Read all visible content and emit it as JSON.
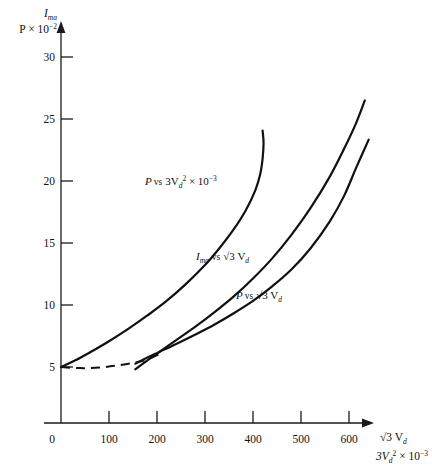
{
  "chart_data": {
    "type": "line",
    "title": "",
    "xlabel_line1": "√3 V",
    "xlabel_line1_sub": "d",
    "xlabel_line2_base": "3V",
    "xlabel_line2_sub": "d",
    "xlabel_line2_sup": "2",
    "xlabel_line2_tail": " × 10",
    "xlabel_line2_exp": "−3",
    "ylabel_line1": "I",
    "ylabel_line1_sub": "ma",
    "ylabel_line2_base": "P × 10",
    "ylabel_line2_exp": "−2",
    "xlim": [
      0,
      680
    ],
    "ylim": [
      0,
      32
    ],
    "grid": false,
    "legend_position": "inline-annotations",
    "xticks": [
      0,
      100,
      200,
      300,
      400,
      500,
      600
    ],
    "xtick_labels": [
      "0",
      "100",
      "200",
      "300",
      "400",
      "500",
      "600"
    ],
    "yticks": [
      5,
      10,
      15,
      20,
      25,
      30
    ],
    "ytick_labels": [
      "5",
      "10",
      "15",
      "20",
      "25",
      "30"
    ],
    "series": [
      {
        "name": "P vs 3Vd2 x 10-3",
        "label_text_base": "P",
        "label_vs": "vs",
        "label_mid": "3V",
        "label_sub": "d",
        "label_sup": "2",
        "label_tail": " × 10",
        "label_exp": "−3",
        "style": "solid",
        "points": [
          [
            0,
            5.0
          ],
          [
            30,
            5.6
          ],
          [
            60,
            6.3
          ],
          [
            100,
            7.3
          ],
          [
            140,
            8.4
          ],
          [
            180,
            9.6
          ],
          [
            220,
            10.9
          ],
          [
            260,
            12.4
          ],
          [
            300,
            14.1
          ],
          [
            330,
            15.6
          ],
          [
            360,
            17.3
          ],
          [
            385,
            19.0
          ],
          [
            405,
            20.8
          ],
          [
            415,
            22.2
          ],
          [
            420,
            23.6
          ],
          [
            422,
            25.0
          ],
          [
            420,
            26.1
          ]
        ]
      },
      {
        "name": "Ima vs sqrt3 Vd",
        "label_text_base": "I",
        "label_sub0": "ma",
        "label_vs": "vs",
        "label_mid": "√3 V",
        "label_sub": "d",
        "style": "solid",
        "points": [
          [
            155,
            4.8
          ],
          [
            180,
            5.6
          ],
          [
            205,
            6.35
          ],
          [
            240,
            7.4
          ],
          [
            280,
            8.6
          ],
          [
            320,
            9.9
          ],
          [
            360,
            11.3
          ],
          [
            400,
            12.9
          ],
          [
            440,
            14.7
          ],
          [
            480,
            16.8
          ],
          [
            520,
            19.2
          ],
          [
            560,
            22.0
          ],
          [
            590,
            24.5
          ],
          [
            615,
            26.8
          ],
          [
            633,
            28.8
          ]
        ]
      },
      {
        "name": "P vs sqrt3 Vd",
        "label_text_base": "P",
        "label_vs": "vs",
        "label_mid": "√3 V",
        "label_sub": "d",
        "style": "solid",
        "points": [
          [
            155,
            5.3
          ],
          [
            180,
            5.85
          ],
          [
            205,
            6.35
          ],
          [
            240,
            7.05
          ],
          [
            280,
            7.9
          ],
          [
            320,
            8.8
          ],
          [
            360,
            9.8
          ],
          [
            400,
            10.9
          ],
          [
            440,
            12.2
          ],
          [
            480,
            13.7
          ],
          [
            520,
            15.6
          ],
          [
            560,
            18.0
          ],
          [
            590,
            20.3
          ],
          [
            615,
            22.8
          ],
          [
            641,
            25.3
          ]
        ]
      },
      {
        "name": "dashed extension",
        "style": "dashed",
        "points": [
          [
            0,
            5.0
          ],
          [
            40,
            4.9
          ],
          [
            80,
            4.95
          ],
          [
            120,
            5.15
          ],
          [
            160,
            5.45
          ],
          [
            190,
            5.85
          ],
          [
            210,
            6.25
          ]
        ]
      }
    ]
  }
}
